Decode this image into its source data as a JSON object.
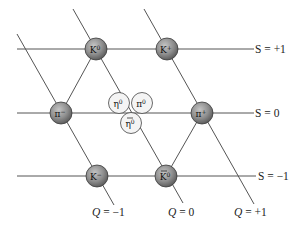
{
  "diagram": {
    "strangeness_labels": [
      {
        "id": "s-plus-1",
        "text": "S = +1",
        "y": 49
      },
      {
        "id": "s-zero",
        "text": "S = 0",
        "y": 113
      },
      {
        "id": "s-minus-1",
        "text": "S = −1",
        "y": 176
      }
    ],
    "charge_labels": [
      {
        "id": "q-minus-1",
        "text": "Q = −1",
        "x": 92
      },
      {
        "id": "q-zero",
        "text": "Q = 0",
        "x": 168
      },
      {
        "id": "q-plus-1",
        "text": "Q = +1",
        "x": 234
      }
    ],
    "particles": [
      {
        "id": "k-zero",
        "symbol": "K",
        "sup": "0",
        "overbar": false,
        "x": 96,
        "y": 49,
        "style": "dark"
      },
      {
        "id": "k-plus",
        "symbol": "K",
        "sup": "+",
        "overbar": false,
        "x": 167,
        "y": 49,
        "style": "dark"
      },
      {
        "id": "pi-minus",
        "symbol": "π",
        "sup": "−",
        "overbar": false,
        "x": 61,
        "y": 113,
        "style": "dark"
      },
      {
        "id": "pi-plus",
        "symbol": "π",
        "sup": "+",
        "overbar": false,
        "x": 202,
        "y": 113,
        "style": "dark"
      },
      {
        "id": "eta-zero",
        "symbol": "η",
        "sup": "0",
        "overbar": false,
        "x": 119,
        "y": 103,
        "style": "light"
      },
      {
        "id": "pi-zero",
        "symbol": "π",
        "sup": "0",
        "overbar": false,
        "x": 142,
        "y": 103,
        "style": "light"
      },
      {
        "id": "eta-prime-zero",
        "symbol": "η",
        "sup": "0",
        "overbar": true,
        "x": 131,
        "y": 123,
        "style": "light"
      },
      {
        "id": "k-minus",
        "symbol": "K",
        "sup": "−",
        "overbar": false,
        "x": 97,
        "y": 176,
        "style": "dark"
      },
      {
        "id": "k-bar-zero",
        "symbol": "K",
        "sup": "0",
        "overbar": true,
        "x": 166,
        "y": 176,
        "style": "dark"
      }
    ],
    "colors": {
      "line": "#555555",
      "dark_node_center": "#b5b5b5",
      "dark_node_edge": "#6a6a6a",
      "light_node": "#f4f4f4"
    }
  }
}
